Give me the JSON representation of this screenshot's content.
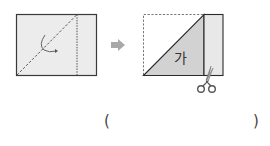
{
  "figure_left": {
    "description": "Rectangular paper folded along dashed diagonal line",
    "colors": {
      "paper_fill": "#ececec",
      "border": "#3a3a3a",
      "dashed_line": "#555555",
      "arrow": "#555555"
    }
  },
  "arrow_icon": {
    "name": "right-arrow",
    "color": "#a8a8a8"
  },
  "figure_right": {
    "description": "Folded paper showing triangle labeled and cut line with scissors",
    "triangle_label": "가",
    "colors": {
      "triangle_fill": "#d2d2d2",
      "strip_fill": "#e8e8e8",
      "border": "#2a2a2a",
      "dashed_outline": "#777777",
      "scissors_handle": "#555555",
      "scissors_blade": "#9a9a9a"
    }
  },
  "answer": {
    "open_paren": "(",
    "close_paren": ")",
    "value": ""
  }
}
